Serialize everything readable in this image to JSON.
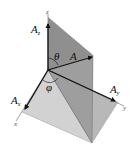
{
  "figure": {
    "type": "3d-vector-decomposition",
    "labels": {
      "vector": "A",
      "component_x": {
        "base": "A",
        "sub": "x"
      },
      "component_y": {
        "base": "A",
        "sub": "y"
      },
      "component_z": {
        "base": "A",
        "sub": "z"
      },
      "polar_angle": "θ",
      "azimuth_angle": "φ",
      "axis_x": "x",
      "axis_y": "y",
      "axis_z": "z"
    },
    "colors": {
      "vertical_plane": "#8c8c8c",
      "base_left": "#cfcfcf",
      "base_right": "#b4b4b4",
      "inner_face": "#a3a3a3",
      "arrow": "#111111",
      "axis": "#777777"
    }
  }
}
